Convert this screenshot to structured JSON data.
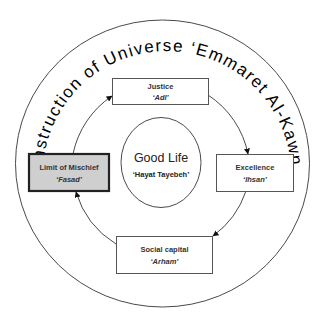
{
  "diagram": {
    "outer_title": "Construction of Universe ‘Emmaret Al-Kawn’",
    "center": {
      "title": "Good Life",
      "subtitle": "‘Hayat Tayebeh’"
    },
    "nodes": [
      {
        "id": "justice",
        "title": "Justice",
        "subtitle": "‘Adl’",
        "highlighted": false
      },
      {
        "id": "excellence",
        "title": "Excellence",
        "subtitle": "‘Ihsan’",
        "highlighted": false
      },
      {
        "id": "social-capital",
        "title": "Social capital",
        "subtitle": "‘Arham’",
        "highlighted": false
      },
      {
        "id": "limit-of-mischief",
        "title": "Limit of Mischief",
        "subtitle": "‘Fasad’",
        "highlighted": true
      }
    ],
    "flow": [
      "Justice",
      "Excellence",
      "Social capital",
      "Limit of Mischief",
      "Justice"
    ],
    "colors": {
      "highlight_fill": "#cfcfcf",
      "line": "#4a4a4a",
      "background": "#ffffff"
    }
  }
}
